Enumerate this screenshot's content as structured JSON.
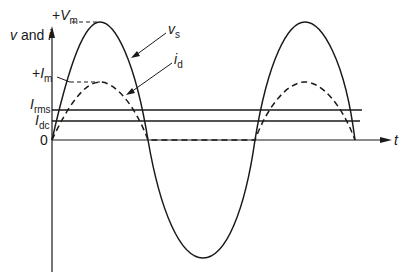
{
  "diagram": {
    "y_axis_label": {
      "var1": "v",
      "conj": " and ",
      "var2": "i"
    },
    "x_axis_label": "t",
    "origin_label": "0",
    "levels": {
      "vm": {
        "prefix": "+",
        "sym": "V",
        "sub": "m"
      },
      "im": {
        "prefix": "+",
        "sym": "I",
        "sub": "m"
      },
      "irms": {
        "sym": "I",
        "sub": "rms"
      },
      "idc": {
        "sym": "I",
        "sub": "dc"
      }
    },
    "curves": {
      "vs": {
        "sym": "v",
        "sub": "s",
        "style": "solid",
        "description": "supply voltage sinusoid"
      },
      "id": {
        "sym": "i",
        "sub": "d",
        "style": "dashed",
        "description": "diode current, positive half-cycles only"
      }
    },
    "colors": {
      "ink": "#1a1a1a",
      "background": "#ffffff"
    }
  }
}
